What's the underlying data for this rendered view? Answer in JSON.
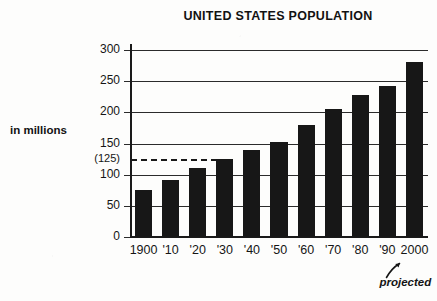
{
  "chart_data": {
    "type": "bar",
    "title": "UNITED STATES POPULATION",
    "xlabel": "",
    "ylabel": "in millions",
    "categories": [
      "1900",
      "'10",
      "'20",
      "'30",
      "'40",
      "'50",
      "'60",
      "'70",
      "'80",
      "'90",
      "2000"
    ],
    "values": [
      76,
      92,
      110,
      125,
      140,
      153,
      180,
      205,
      228,
      243,
      280
    ],
    "ylim": [
      0,
      300
    ],
    "yticks": [
      0,
      50,
      100,
      150,
      200,
      250,
      300
    ],
    "ytick_labels": [
      "0",
      "50",
      "100",
      "150",
      "200",
      "250",
      "300"
    ],
    "grid": true,
    "legend": false,
    "bar_color": "#171717",
    "reference_line": {
      "value": 125,
      "label": "(125)",
      "style": "dashed",
      "extends_to_category": "'30"
    },
    "annotations": [
      {
        "text": "projected",
        "style": "italic",
        "points_to_category": "2000"
      }
    ]
  },
  "chart": {
    "title": "UNITED STATES POPULATION",
    "y_axis_label": "in millions",
    "y_ticks": [
      {
        "label": "300",
        "value": 300
      },
      {
        "label": "250",
        "value": 250
      },
      {
        "label": "200",
        "value": 200
      },
      {
        "label": "150",
        "value": 150
      },
      {
        "label": "(125)",
        "value": 125
      },
      {
        "label": "100",
        "value": 100
      },
      {
        "label": "50",
        "value": 50
      },
      {
        "label": "0",
        "value": 0
      }
    ],
    "x_ticks": [
      {
        "label": "1900",
        "value": 76
      },
      {
        "label": "'10",
        "value": 92
      },
      {
        "label": "'20",
        "value": 110
      },
      {
        "label": "'30",
        "value": 125
      },
      {
        "label": "'40",
        "value": 140
      },
      {
        "label": "'50",
        "value": 153
      },
      {
        "label": "'60",
        "value": 180
      },
      {
        "label": "'70",
        "value": 205
      },
      {
        "label": "'80",
        "value": 228
      },
      {
        "label": "'90",
        "value": 243
      },
      {
        "label": "2000",
        "value": 280
      }
    ],
    "annotation": "projected",
    "colors": {
      "bar": "#171717",
      "axis": "#1a1a1a",
      "grid": "#2b2b2b",
      "text": "#151515",
      "background": "#fdfdfc"
    }
  }
}
